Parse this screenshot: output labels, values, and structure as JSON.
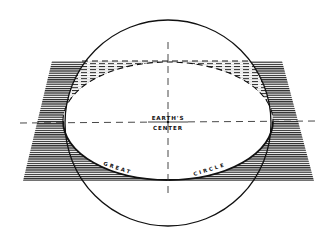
{
  "diagram": {
    "type": "geometry-illustration",
    "labels": {
      "center_line1": "EARTH'S",
      "center_line2": "CENTER",
      "great": "GREAT",
      "circle": "CIRCLE"
    },
    "colors": {
      "ink": "#111111",
      "hatch": "#222222",
      "background": "#ffffff"
    }
  }
}
